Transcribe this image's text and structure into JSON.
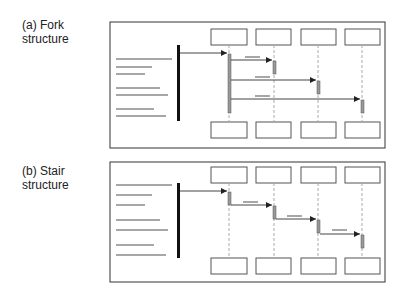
{
  "panels": [
    {
      "id": "fork",
      "label_line1": "(a) Fork",
      "label_line2": "structure"
    },
    {
      "id": "stair",
      "label_line1": "(b) Stair",
      "label_line2": "structure"
    }
  ],
  "colors": {
    "frame": "#333333",
    "box": "#555555",
    "text_bar": "#8a8a8a",
    "activation": "#999999",
    "lifeline": "#aaaaaa",
    "caller_bar": "#111111",
    "arrow": "#444444"
  }
}
